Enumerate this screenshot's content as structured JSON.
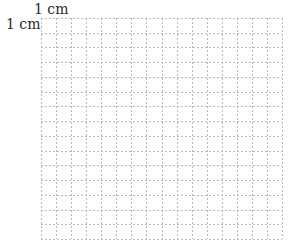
{
  "diagram": {
    "type": "grid-paper",
    "labels": {
      "top": "1 cm",
      "left": "1 cm"
    },
    "grid": {
      "columns": 16,
      "rows": 15,
      "cell_unit": "1 cm",
      "line_style": "dashed",
      "line_color": "#b8b8b8"
    }
  }
}
